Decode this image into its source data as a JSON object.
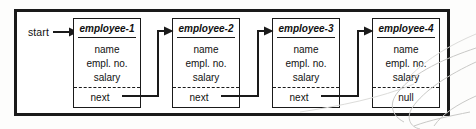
{
  "diagram": {
    "type": "linked-list",
    "colors": {
      "ink": "#1a1a1a",
      "paper": "#ffffff",
      "canvas": "#fdfdfc"
    },
    "start": {
      "label": "start",
      "arrow_icon": "arrow-right-icon"
    },
    "nodes": [
      {
        "id": "employee-1",
        "title": "employee-1",
        "fields": [
          "name",
          "empl. no.",
          "salary"
        ],
        "pointer_label": "next",
        "pointer_is_null": false,
        "links_to": "employee-2"
      },
      {
        "id": "employee-2",
        "title": "employee-2",
        "fields": [
          "name",
          "empl. no.",
          "salary"
        ],
        "pointer_label": "next",
        "pointer_is_null": false,
        "links_to": "employee-3"
      },
      {
        "id": "employee-3",
        "title": "employee-3",
        "fields": [
          "name",
          "empl. no.",
          "salary"
        ],
        "pointer_label": "next",
        "pointer_is_null": false,
        "links_to": "employee-4"
      },
      {
        "id": "employee-4",
        "title": "employee-4",
        "fields": [
          "name",
          "empl. no.",
          "salary"
        ],
        "pointer_label": "null",
        "pointer_is_null": true,
        "links_to": null
      }
    ]
  }
}
